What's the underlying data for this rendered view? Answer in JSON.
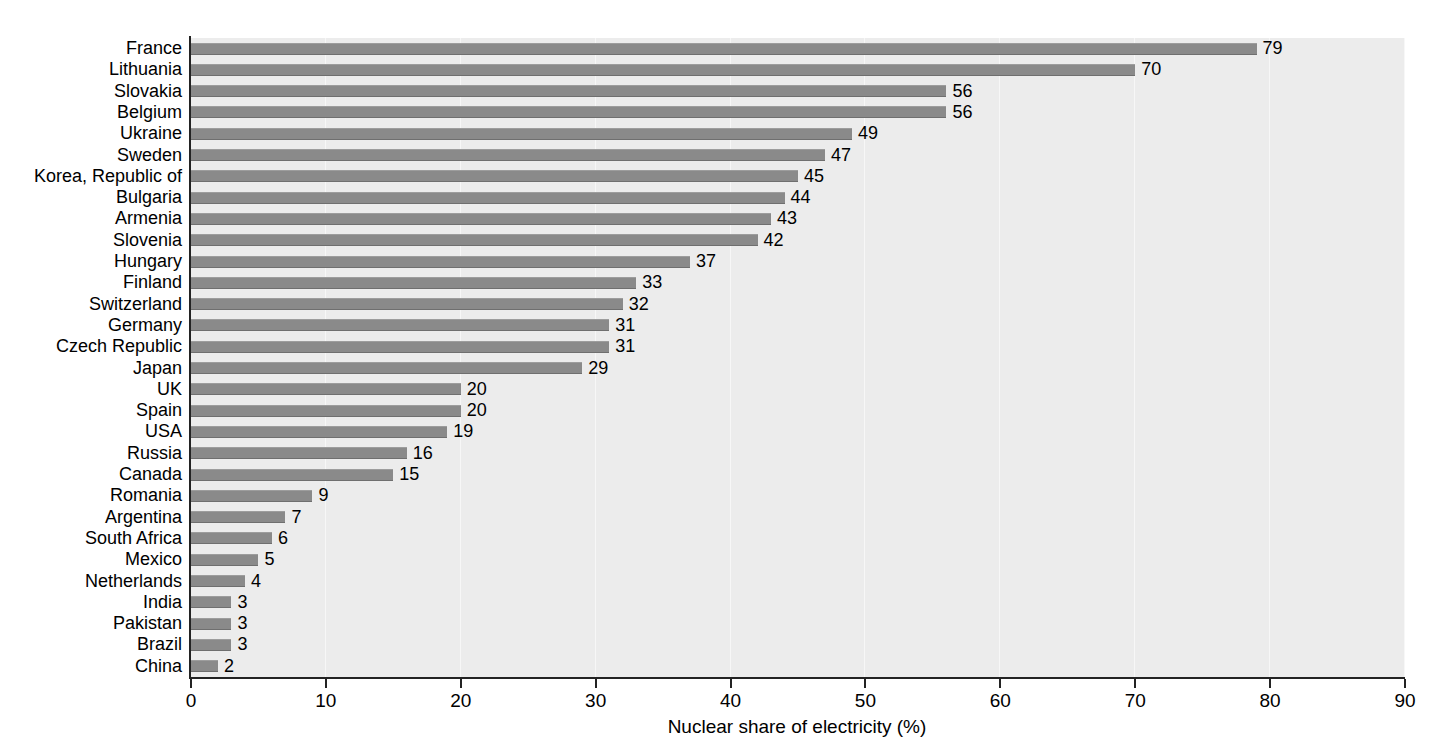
{
  "chart_data": {
    "type": "bar",
    "orientation": "horizontal",
    "title": "",
    "xlabel": "Nuclear share of electricity (%)",
    "ylabel": "",
    "xlim": [
      0,
      90
    ],
    "xticks": [
      0,
      10,
      20,
      30,
      40,
      50,
      60,
      70,
      80,
      90
    ],
    "xtick_labels": [
      "0",
      "10",
      "20",
      "30",
      "40",
      "50",
      "60",
      "70",
      "80",
      "90"
    ],
    "grid": "vertical-only",
    "legend": "none",
    "bar_color": "#8a8a8a",
    "plot_background": "#ececec",
    "categories": [
      "France",
      "Lithuania",
      "Slovakia",
      "Belgium",
      "Ukraine",
      "Sweden",
      "Korea, Republic of",
      "Bulgaria",
      "Armenia",
      "Slovenia",
      "Hungary",
      "Finland",
      "Switzerland",
      "Germany",
      "Czech Republic",
      "Japan",
      "UK",
      "Spain",
      "USA",
      "Russia",
      "Canada",
      "Romania",
      "Argentina",
      "South Africa",
      "Mexico",
      "Netherlands",
      "India",
      "Pakistan",
      "Brazil",
      "China"
    ],
    "values": [
      79,
      70,
      56,
      56,
      49,
      47,
      45,
      44,
      43,
      42,
      37,
      33,
      32,
      31,
      31,
      29,
      20,
      20,
      19,
      16,
      15,
      9,
      7,
      6,
      5,
      4,
      3,
      3,
      3,
      2
    ],
    "value_labels": [
      "79",
      "70",
      "56",
      "56",
      "49",
      "47",
      "45",
      "44",
      "43",
      "42",
      "37",
      "33",
      "32",
      "31",
      "31",
      "29",
      "20",
      "20",
      "19",
      "16",
      "15",
      "9",
      "7",
      "6",
      "5",
      "4",
      "3",
      "3",
      "3",
      "2"
    ]
  }
}
